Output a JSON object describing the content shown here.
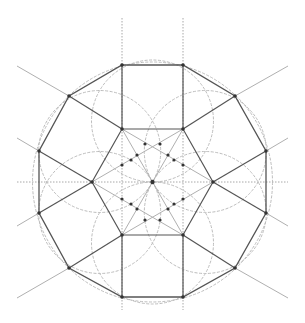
{
  "diagram": {
    "title": "Geometric construction of a regular dodecagon with inscribed hexagon and circles",
    "canvas": {
      "width": 305,
      "height": 323,
      "background": "#ffffff"
    },
    "center": {
      "x": 152.5,
      "y": 182
    },
    "colors": {
      "solid_line": "#555555",
      "construction_line": "#b0b0b0",
      "dotted_line": "#a8a8a8",
      "circle": "#bdbdbd",
      "vertex_point": "#333333"
    },
    "outer_dodecagon": {
      "vertices": [
        [
          122,
          65
        ],
        [
          183,
          65
        ],
        [
          235,
          96
        ],
        [
          266,
          151
        ],
        [
          266,
          213
        ],
        [
          235,
          268
        ],
        [
          183,
          297
        ],
        [
          122,
          297
        ],
        [
          69,
          268
        ],
        [
          39,
          213
        ],
        [
          39,
          151
        ],
        [
          69,
          96
        ]
      ]
    },
    "inner_hexagon": {
      "vertices": [
        [
          122,
          129
        ],
        [
          183,
          129
        ],
        [
          213,
          182
        ],
        [
          183,
          235
        ],
        [
          122,
          235
        ],
        [
          92,
          182
        ]
      ]
    },
    "circles": [
      {
        "cx": 152.5,
        "cy": 182,
        "r": 120
      },
      {
        "cx": 152.5,
        "cy": 121,
        "r": 61
      },
      {
        "cx": 205.3,
        "cy": 151.5,
        "r": 61
      },
      {
        "cx": 205.3,
        "cy": 212.5,
        "r": 61
      },
      {
        "cx": 152.5,
        "cy": 243,
        "r": 61
      },
      {
        "cx": 99.7,
        "cy": 212.5,
        "r": 61
      },
      {
        "cx": 99.7,
        "cy": 151.5,
        "r": 61
      }
    ],
    "spokes": [
      [
        [
          122,
          129
        ],
        [
          69,
          96
        ]
      ],
      [
        [
          183,
          129
        ],
        [
          235,
          96
        ]
      ],
      [
        [
          213,
          182
        ],
        [
          266,
          151
        ]
      ],
      [
        [
          213,
          182
        ],
        [
          266,
          213
        ]
      ],
      [
        [
          183,
          235
        ],
        [
          235,
          268
        ]
      ],
      [
        [
          122,
          235
        ],
        [
          69,
          268
        ]
      ],
      [
        [
          92,
          182
        ],
        [
          39,
          151
        ]
      ],
      [
        [
          92,
          182
        ],
        [
          39,
          213
        ]
      ],
      [
        [
          122,
          129
        ],
        [
          122,
          65
        ]
      ],
      [
        [
          183,
          129
        ],
        [
          183,
          65
        ]
      ],
      [
        [
          122,
          235
        ],
        [
          122,
          297
        ]
      ],
      [
        [
          183,
          235
        ],
        [
          183,
          297
        ]
      ]
    ],
    "extension_lines": [
      [
        [
          69,
          96
        ],
        [
          17,
          66
        ]
      ],
      [
        [
          235,
          96
        ],
        [
          288,
          66
        ]
      ],
      [
        [
          39,
          213
        ],
        [
          17,
          226
        ]
      ],
      [
        [
          39,
          151
        ],
        [
          17,
          138
        ]
      ],
      [
        [
          266,
          151
        ],
        [
          288,
          138
        ]
      ],
      [
        [
          266,
          213
        ],
        [
          288,
          226
        ]
      ],
      [
        [
          69,
          268
        ],
        [
          17,
          298
        ]
      ],
      [
        [
          235,
          268
        ],
        [
          288,
          298
        ]
      ]
    ],
    "dotted_axes": [
      [
        [
          122,
          18
        ],
        [
          122,
          310
        ]
      ],
      [
        [
          183,
          18
        ],
        [
          183,
          310
        ]
      ],
      [
        [
          17,
          182
        ],
        [
          288,
          182
        ]
      ]
    ],
    "inner_lines": [
      [
        [
          92,
          182
        ],
        [
          183,
          129
        ]
      ],
      [
        [
          92,
          182
        ],
        [
          183,
          235
        ]
      ],
      [
        [
          213,
          182
        ],
        [
          122,
          129
        ]
      ],
      [
        [
          213,
          182
        ],
        [
          122,
          235
        ]
      ],
      [
        [
          122,
          129
        ],
        [
          183,
          235
        ]
      ],
      [
        [
          183,
          129
        ],
        [
          122,
          235
        ]
      ]
    ],
    "inner_points": [
      [
        152.5,
        182
      ],
      [
        122,
        165
      ],
      [
        122,
        199
      ],
      [
        183,
        165
      ],
      [
        183,
        199
      ],
      [
        131,
        160
      ],
      [
        137,
        155
      ],
      [
        168,
        155
      ],
      [
        174,
        160
      ],
      [
        131,
        204
      ],
      [
        137,
        209
      ],
      [
        168,
        209
      ],
      [
        174,
        204
      ],
      [
        145,
        144
      ],
      [
        160,
        144
      ],
      [
        145,
        220
      ],
      [
        160,
        220
      ]
    ]
  }
}
